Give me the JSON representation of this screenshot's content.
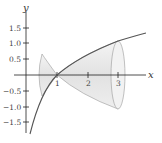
{
  "figure": {
    "x_axis": {
      "label": "x",
      "ticks": [
        "1",
        "2",
        "3"
      ]
    },
    "y_axis": {
      "label": "y",
      "ticks": [
        "1.5",
        "1.0",
        "0.5",
        "−0.5",
        "−1.0",
        "−1.5"
      ]
    },
    "curve": "y = ln x",
    "solid_interval": [
      0.5,
      3
    ],
    "colors": {
      "axis": "#222222",
      "curve": "#555555",
      "solid_fill": "#e6e6e6",
      "solid_edge": "#999999"
    }
  }
}
